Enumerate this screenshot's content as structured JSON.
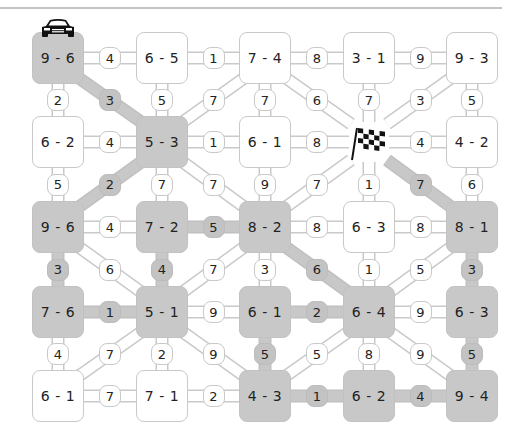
{
  "puzzle": {
    "title": "",
    "colors": {
      "path_fill": "#c8c8c8",
      "outline": "#c9c9c9",
      "background": "#ffffff",
      "text": "#222222"
    },
    "start_icon": "race-car-icon",
    "finish_icon": "checkered-flag-icon",
    "grid": [
      [
        {
          "label": "9 - 6",
          "hl": true,
          "icon": "car"
        },
        {
          "label": "6 - 5",
          "hl": false
        },
        {
          "label": "7 - 4",
          "hl": false
        },
        {
          "label": "3 - 1",
          "hl": false
        },
        {
          "label": "9 - 3",
          "hl": false
        }
      ],
      [
        {
          "label": "6 - 2",
          "hl": false
        },
        {
          "label": "5 - 3",
          "hl": true
        },
        {
          "label": "6 - 1",
          "hl": false
        },
        {
          "label": "",
          "hl": false,
          "icon": "flag"
        },
        {
          "label": "4 - 2",
          "hl": false
        }
      ],
      [
        {
          "label": "9 - 6",
          "hl": true
        },
        {
          "label": "7 - 2",
          "hl": true
        },
        {
          "label": "8 - 2",
          "hl": true
        },
        {
          "label": "6 - 3",
          "hl": false
        },
        {
          "label": "8 - 1",
          "hl": true
        }
      ],
      [
        {
          "label": "7 - 6",
          "hl": true
        },
        {
          "label": "5 - 1",
          "hl": true
        },
        {
          "label": "6 - 1",
          "hl": true
        },
        {
          "label": "6 - 4",
          "hl": true
        },
        {
          "label": "6 - 3",
          "hl": true
        }
      ],
      [
        {
          "label": "6 - 1",
          "hl": false
        },
        {
          "label": "7 - 1",
          "hl": false
        },
        {
          "label": "4 - 3",
          "hl": true
        },
        {
          "label": "6 - 2",
          "hl": true
        },
        {
          "label": "9 - 4",
          "hl": true
        }
      ]
    ],
    "horizontal": [
      [
        {
          "v": "4",
          "hl": false
        },
        {
          "v": "1",
          "hl": false
        },
        {
          "v": "8",
          "hl": false
        },
        {
          "v": "9",
          "hl": false
        }
      ],
      [
        {
          "v": "4",
          "hl": false
        },
        {
          "v": "1",
          "hl": false
        },
        {
          "v": "8",
          "hl": false
        },
        {
          "v": "4",
          "hl": false
        }
      ],
      [
        {
          "v": "4",
          "hl": false
        },
        {
          "v": "5",
          "hl": true
        },
        {
          "v": "8",
          "hl": false
        },
        {
          "v": "8",
          "hl": false
        }
      ],
      [
        {
          "v": "1",
          "hl": true
        },
        {
          "v": "9",
          "hl": false
        },
        {
          "v": "2",
          "hl": true
        },
        {
          "v": "9",
          "hl": false
        }
      ],
      [
        {
          "v": "7",
          "hl": false
        },
        {
          "v": "2",
          "hl": false
        },
        {
          "v": "1",
          "hl": true
        },
        {
          "v": "4",
          "hl": true
        }
      ]
    ],
    "vertical": [
      [
        {
          "v": "2",
          "hl": false
        },
        {
          "v": "5",
          "hl": false
        },
        {
          "v": "7",
          "hl": false
        },
        {
          "v": "7",
          "hl": false
        },
        {
          "v": "5",
          "hl": false
        }
      ],
      [
        {
          "v": "5",
          "hl": false
        },
        {
          "v": "7",
          "hl": false
        },
        {
          "v": "9",
          "hl": false
        },
        {
          "v": "1",
          "hl": false
        },
        {
          "v": "6",
          "hl": false
        }
      ],
      [
        {
          "v": "3",
          "hl": true
        },
        {
          "v": "4",
          "hl": true
        },
        {
          "v": "3",
          "hl": false
        },
        {
          "v": "1",
          "hl": false
        },
        {
          "v": "3",
          "hl": true
        }
      ],
      [
        {
          "v": "4",
          "hl": false
        },
        {
          "v": "2",
          "hl": false
        },
        {
          "v": "5",
          "hl": true
        },
        {
          "v": "8",
          "hl": false
        },
        {
          "v": "5",
          "hl": true
        }
      ]
    ],
    "diagonal": [
      [
        {
          "v": "3",
          "hl": true,
          "dir": "down"
        },
        {
          "v": "7",
          "hl": false,
          "dir": "up"
        },
        {
          "v": "6",
          "hl": false,
          "dir": "down"
        },
        {
          "v": "3",
          "hl": false,
          "dir": "up"
        }
      ],
      [
        {
          "v": "2",
          "hl": true,
          "dir": "up"
        },
        {
          "v": "7",
          "hl": false,
          "dir": "down"
        },
        {
          "v": "7",
          "hl": false,
          "dir": "up"
        },
        {
          "v": "7",
          "hl": true,
          "dir": "down"
        }
      ],
      [
        {
          "v": "6",
          "hl": false,
          "dir": "down"
        },
        {
          "v": "7",
          "hl": false,
          "dir": "up"
        },
        {
          "v": "6",
          "hl": true,
          "dir": "down"
        },
        {
          "v": "5",
          "hl": false,
          "dir": "up"
        }
      ],
      [
        {
          "v": "7",
          "hl": false,
          "dir": "up"
        },
        {
          "v": "9",
          "hl": false,
          "dir": "down"
        },
        {
          "v": "5",
          "hl": false,
          "dir": "up"
        },
        {
          "v": "9",
          "hl": false,
          "dir": "down"
        }
      ]
    ]
  }
}
